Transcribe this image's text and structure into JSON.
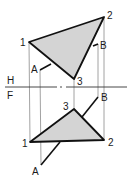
{
  "diagram": {
    "type": "descriptive-geometry-orthographic",
    "colors": {
      "fill": "#d4d4d4",
      "stroke": "#111111",
      "projection": "#8a8a8a"
    },
    "fold_line": {
      "y": 87,
      "top_label": "H",
      "bottom_label": "F"
    },
    "top_view": {
      "name": "H",
      "triangle": {
        "p1": [
          29,
          42
        ],
        "p2": [
          104,
          17
        ],
        "p3": [
          74,
          79
        ]
      },
      "line_AB": {
        "A": [
          40,
          70
        ],
        "B": [
          98,
          44
        ]
      },
      "labels": {
        "p1": "1",
        "p2": "2",
        "p3": "3",
        "A": "A",
        "B": "B"
      }
    },
    "front_view": {
      "name": "F",
      "triangle": {
        "p1": [
          30,
          142
        ],
        "p2": [
          104,
          140
        ],
        "p3": [
          74,
          109
        ]
      },
      "line_AB": {
        "A": [
          41,
          165
        ],
        "B": [
          98,
          97
        ]
      },
      "labels": {
        "p1": "1",
        "p2": "2",
        "p3": "3",
        "A": "A",
        "B": "B"
      }
    }
  }
}
